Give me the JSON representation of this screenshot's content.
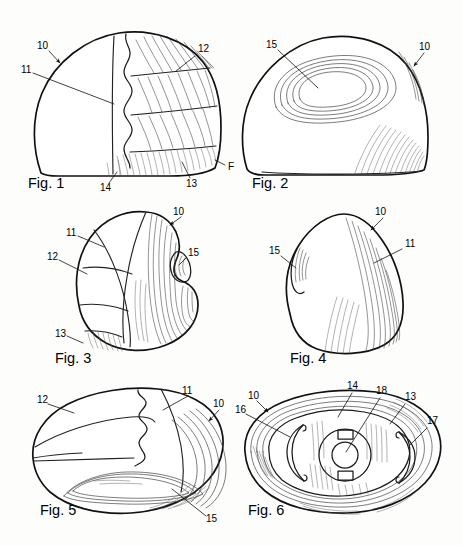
{
  "sheet": {
    "title": "Patent drawing sheet",
    "background_color": "#fdfdfc",
    "ink_color": "#111111",
    "width": 462,
    "height": 546
  },
  "figures": [
    {
      "id": "fig1",
      "caption": "Fig. 1",
      "caption_x": 28,
      "caption_y": 186,
      "description": "Perspective view of a rounded dome-shaped body with ribbed segmented surface on the right half",
      "labels": [
        {
          "text": "10",
          "x": 37,
          "y": 47
        },
        {
          "text": "11",
          "x": 21,
          "y": 71
        },
        {
          "text": "12",
          "x": 198,
          "y": 50
        },
        {
          "text": "13",
          "x": 190,
          "y": 183
        },
        {
          "text": "14",
          "x": 102,
          "y": 188
        },
        {
          "text": "F",
          "x": 228,
          "y": 168
        }
      ]
    },
    {
      "id": "fig2",
      "caption": "Fig. 2",
      "caption_x": 252,
      "caption_y": 186,
      "description": "Side elevation of the body showing concentric oval contour lines near the top centre",
      "labels": [
        {
          "text": "15",
          "x": 268,
          "y": 46
        },
        {
          "text": "10",
          "x": 419,
          "y": 48
        }
      ]
    },
    {
      "id": "fig3",
      "caption": "Fig. 3",
      "caption_x": 55,
      "caption_y": 361,
      "description": "Three-quarter perspective view showing banded segments and a notch on the right flank",
      "labels": [
        {
          "text": "10",
          "x": 173,
          "y": 213
        },
        {
          "text": "11",
          "x": 67,
          "y": 234
        },
        {
          "text": "12",
          "x": 48,
          "y": 258
        },
        {
          "text": "13",
          "x": 56,
          "y": 335
        },
        {
          "text": "15",
          "x": 189,
          "y": 254
        }
      ]
    },
    {
      "id": "fig4",
      "caption": "Fig. 4",
      "caption_x": 290,
      "caption_y": 361,
      "description": "Opposite side elevation with flow lines along the right face and a notch on the left",
      "labels": [
        {
          "text": "10",
          "x": 375,
          "y": 213
        },
        {
          "text": "11",
          "x": 405,
          "y": 245
        },
        {
          "text": "15",
          "x": 270,
          "y": 252
        }
      ]
    },
    {
      "id": "fig5",
      "caption": "Fig. 5",
      "caption_x": 40,
      "caption_y": 513,
      "description": "Top plan view of the ovoid body with segment divisions and an elongated slot contour",
      "labels": [
        {
          "text": "11",
          "x": 182,
          "y": 392
        },
        {
          "text": "12",
          "x": 38,
          "y": 401
        },
        {
          "text": "10",
          "x": 213,
          "y": 405
        },
        {
          "text": "15",
          "x": 208,
          "y": 520
        }
      ]
    },
    {
      "id": "fig6",
      "caption": "Fig. 6",
      "caption_x": 248,
      "caption_y": 513,
      "description": "Bottom plan view showing the recessed underside, two arcuate ribs and a central boss with a through bore",
      "labels": [
        {
          "text": "14",
          "x": 349,
          "y": 387
        },
        {
          "text": "18",
          "x": 378,
          "y": 392
        },
        {
          "text": "13",
          "x": 407,
          "y": 398
        },
        {
          "text": "10",
          "x": 249,
          "y": 397
        },
        {
          "text": "16",
          "x": 236,
          "y": 411
        },
        {
          "text": "17",
          "x": 428,
          "y": 422
        }
      ]
    }
  ],
  "reference_numerals": {
    "10": "body / outer shell",
    "11": "smooth upper surface region",
    "12": "segment band",
    "13": "lower rim / edge zone",
    "14": "base surface",
    "15": "recess / notch contour",
    "16": "arcuate rib, left",
    "17": "arcuate rib, right",
    "18": "central boss with bore",
    "F": "edge designation"
  }
}
